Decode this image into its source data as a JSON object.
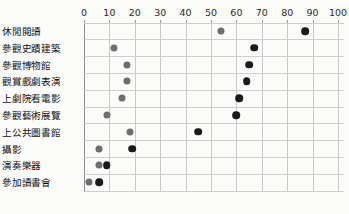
{
  "chart_data": {
    "type": "scatter",
    "title": "",
    "subtitle": "",
    "xlabel": "",
    "ylabel": "",
    "orientation": "horizontal",
    "xlim": [
      0,
      100
    ],
    "xticks": [
      0,
      10,
      20,
      30,
      40,
      50,
      60,
      70,
      80,
      90,
      100
    ],
    "xtick_labels": [
      "0",
      "10",
      "20",
      "30",
      "40",
      "50",
      "60",
      "70",
      "80",
      "90",
      "100"
    ],
    "grid": "both",
    "legend": "none",
    "categories": [
      "休閒閱讀",
      "參觀史蹟建築",
      "參觀博物館",
      "觀賞戲劇表演",
      "上劇院看電影",
      "參觀藝術展覽",
      "上公共圖書館",
      "攝影",
      "演奏樂器",
      "參加讀書會"
    ],
    "series": [
      {
        "name": "series-1",
        "color": "#6e6e6e",
        "values": [
          54,
          12,
          17,
          17,
          15,
          9,
          18,
          6,
          6,
          2
        ]
      },
      {
        "name": "series-2",
        "color": "#1a1a1a",
        "values": [
          87,
          67,
          65,
          64,
          61,
          60,
          45,
          19,
          9,
          6
        ]
      }
    ]
  },
  "figure": {
    "background_color": "#fbfbfa",
    "grid_color": "#cfcfcf",
    "axis_color": "#8d8d8d"
  }
}
